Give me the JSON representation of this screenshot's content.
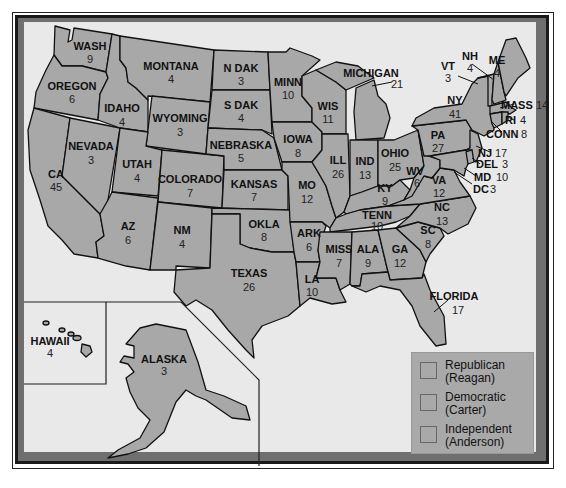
{
  "map": {
    "title": "1980 Presidential Election Electoral Votes",
    "states": [
      {
        "id": "wa",
        "name": "WASH",
        "votes": "9"
      },
      {
        "id": "or",
        "name": "OREGON",
        "votes": "6"
      },
      {
        "id": "ca",
        "name": "CA",
        "votes": "45"
      },
      {
        "id": "nv",
        "name": "NEVADA",
        "votes": "3"
      },
      {
        "id": "id",
        "name": "IDAHO",
        "votes": "4"
      },
      {
        "id": "mt",
        "name": "MONTANA",
        "votes": "4"
      },
      {
        "id": "wy",
        "name": "WYOMING",
        "votes": "3"
      },
      {
        "id": "ut",
        "name": "UTAH",
        "votes": "4"
      },
      {
        "id": "co",
        "name": "COLORADO",
        "votes": "7"
      },
      {
        "id": "az",
        "name": "AZ",
        "votes": "6"
      },
      {
        "id": "nm",
        "name": "NM",
        "votes": "4"
      },
      {
        "id": "nd",
        "name": "N DAK",
        "votes": "3"
      },
      {
        "id": "sd",
        "name": "S DAK",
        "votes": "4"
      },
      {
        "id": "ne",
        "name": "NEBRASKA",
        "votes": "5"
      },
      {
        "id": "ks",
        "name": "KANSAS",
        "votes": "7"
      },
      {
        "id": "ok",
        "name": "OKLA",
        "votes": "8"
      },
      {
        "id": "tx",
        "name": "TEXAS",
        "votes": "26"
      },
      {
        "id": "mn",
        "name": "MINN",
        "votes": "10"
      },
      {
        "id": "ia",
        "name": "IOWA",
        "votes": "8"
      },
      {
        "id": "mo",
        "name": "MO",
        "votes": "12"
      },
      {
        "id": "ar",
        "name": "ARK",
        "votes": "6"
      },
      {
        "id": "la",
        "name": "LA",
        "votes": "10"
      },
      {
        "id": "wi",
        "name": "WIS",
        "votes": "11"
      },
      {
        "id": "il",
        "name": "ILL",
        "votes": "26"
      },
      {
        "id": "mi",
        "name": "MICHIGAN",
        "votes": "21"
      },
      {
        "id": "in",
        "name": "IND",
        "votes": "13"
      },
      {
        "id": "oh",
        "name": "OHIO",
        "votes": "25"
      },
      {
        "id": "ky",
        "name": "KY",
        "votes": "9"
      },
      {
        "id": "tn",
        "name": "TENN",
        "votes": "10"
      },
      {
        "id": "ms",
        "name": "MISS",
        "votes": "7"
      },
      {
        "id": "al",
        "name": "ALA",
        "votes": "9"
      },
      {
        "id": "ga",
        "name": "GA",
        "votes": "12"
      },
      {
        "id": "fl",
        "name": "FLORIDA",
        "votes": "17"
      },
      {
        "id": "sc",
        "name": "SC",
        "votes": "8"
      },
      {
        "id": "nc",
        "name": "NC",
        "votes": "13"
      },
      {
        "id": "va",
        "name": "VA",
        "votes": "12"
      },
      {
        "id": "wv",
        "name": "WV",
        "votes": "6"
      },
      {
        "id": "pa",
        "name": "PA",
        "votes": "27"
      },
      {
        "id": "ny",
        "name": "NY",
        "votes": "41"
      },
      {
        "id": "vt",
        "name": "VT",
        "votes": "3"
      },
      {
        "id": "nh",
        "name": "NH",
        "votes": "4"
      },
      {
        "id": "me",
        "name": "ME",
        "votes": "4"
      },
      {
        "id": "ma",
        "name": "MASS",
        "votes": "14"
      },
      {
        "id": "ri",
        "name": "RI",
        "votes": "4"
      },
      {
        "id": "ct",
        "name": "CONN",
        "votes": "8"
      },
      {
        "id": "nj",
        "name": "NJ",
        "votes": "17"
      },
      {
        "id": "de",
        "name": "DEL",
        "votes": "3"
      },
      {
        "id": "md",
        "name": "MD",
        "votes": "10"
      },
      {
        "id": "dc",
        "name": "DC",
        "votes": "3"
      },
      {
        "id": "ak",
        "name": "ALASKA",
        "votes": "3"
      },
      {
        "id": "hi",
        "name": "HAWAII",
        "votes": "4"
      }
    ]
  },
  "legend": {
    "items": [
      {
        "party": "Republican",
        "candidate": "(Reagan)",
        "color": "#a9a9a9"
      },
      {
        "party": "Democratic",
        "candidate": "(Carter)",
        "color": "#a9a9a9"
      },
      {
        "party": "Independent",
        "candidate": "(Anderson)",
        "color": "#a9a9a9"
      }
    ]
  },
  "colors": {
    "state_fill": "#a8a8a8",
    "background": "#e9e9e9",
    "frame": "#6f6f6f",
    "outline": "#111111"
  }
}
